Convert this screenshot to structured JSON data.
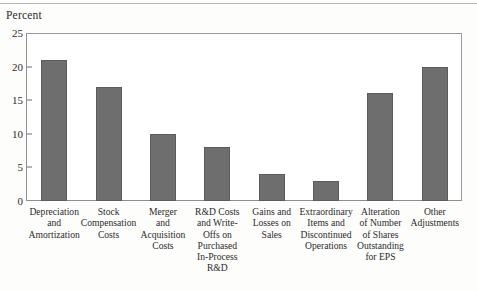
{
  "chart_data": {
    "type": "bar",
    "title": "",
    "subtitle": "",
    "ylabel": "Percent",
    "xlabel": "",
    "ylim": [
      0,
      25
    ],
    "yticks": [
      0,
      5,
      10,
      15,
      20,
      25
    ],
    "ytick_labels": [
      "0",
      "5",
      "10",
      "15",
      "20",
      "25"
    ],
    "grid": false,
    "legend": null,
    "bar_color": "#6e6e6e",
    "categories": [
      "Depreciation and Amortization",
      "Stock Compensation Costs",
      "Merger and Acquisition Costs",
      "R&D Costs and Write-Offs on Purchased In-Process R&D",
      "Gains and Losses on Sales",
      "Extraordinary Items and Discontinued Operations",
      "Alteration of Number of Shares Outstanding for EPS",
      "Other Adjustments"
    ],
    "category_lines": [
      [
        "Depreciation",
        "and",
        "Amortization"
      ],
      [
        "Stock",
        "Compensation",
        "Costs"
      ],
      [
        "Merger",
        "and",
        "Acquisition",
        "Costs"
      ],
      [
        "R&D Costs",
        "and Write-",
        "Offs on",
        "Purchased",
        "In-Process",
        "R&D"
      ],
      [
        "Gains and",
        "Losses on",
        "Sales"
      ],
      [
        "Extraordinary",
        "Items and",
        "Discontinued",
        "Operations"
      ],
      [
        "Alteration",
        "of Number",
        "of Shares",
        "Outstanding",
        "for EPS"
      ],
      [
        "Other",
        "Adjustments"
      ]
    ],
    "values": [
      21,
      17,
      10,
      8,
      4,
      3,
      16,
      20
    ]
  }
}
